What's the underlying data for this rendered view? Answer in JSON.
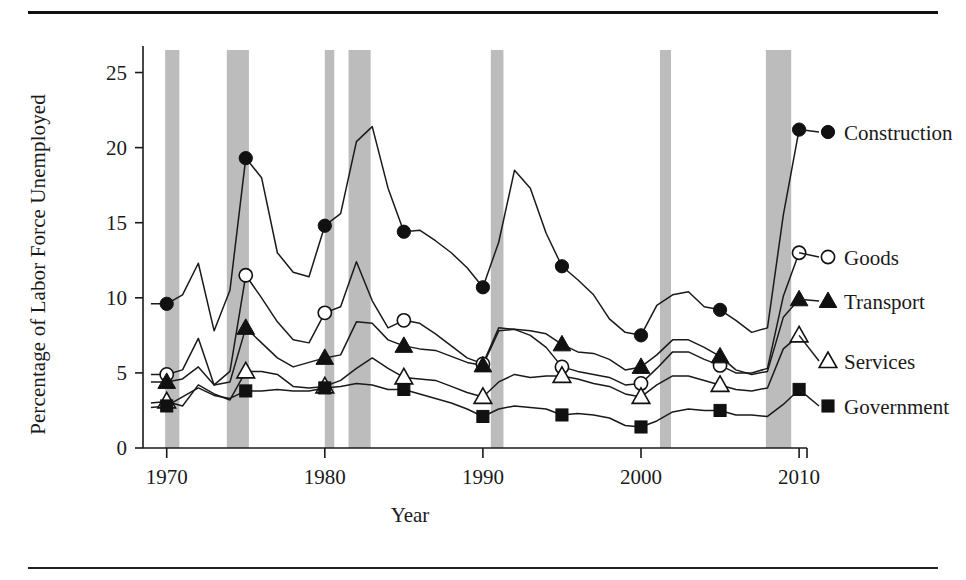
{
  "figure": {
    "xlabel": "Year",
    "ylabel": "Percentage of Labor Force Unemployed"
  },
  "chart_data": {
    "type": "line",
    "title": "",
    "xlabel": "Year",
    "ylabel": "Percentage of Labor Force Unemployed",
    "xlim": [
      1968.5,
      2010.5
    ],
    "ylim": [
      0,
      26.5
    ],
    "xticks": [
      1970,
      1980,
      1990,
      2000,
      2010
    ],
    "yticks": [
      0,
      5,
      10,
      15,
      20,
      25
    ],
    "grid": false,
    "legend_position": "right-outside",
    "marker_interval_years": 5,
    "recession_bands": [
      {
        "start": 1969.9,
        "end": 1970.8
      },
      {
        "start": 1973.8,
        "end": 1975.2
      },
      {
        "start": 1980.0,
        "end": 1980.6
      },
      {
        "start": 1981.5,
        "end": 1982.9
      },
      {
        "start": 1990.5,
        "end": 1991.3
      },
      {
        "start": 2001.2,
        "end": 2001.9
      },
      {
        "start": 2007.9,
        "end": 2009.5
      }
    ],
    "x": [
      1969,
      1970,
      1971,
      1972,
      1973,
      1974,
      1975,
      1976,
      1977,
      1978,
      1979,
      1980,
      1981,
      1982,
      1983,
      1984,
      1985,
      1986,
      1987,
      1988,
      1989,
      1990,
      1991,
      1992,
      1993,
      1994,
      1995,
      1996,
      1997,
      1998,
      1999,
      2000,
      2001,
      2002,
      2003,
      2004,
      2005,
      2006,
      2007,
      2008,
      2009,
      2010
    ],
    "series": [
      {
        "name": "Construction",
        "marker": "filled-circle",
        "values": [
          9.6,
          9.6,
          10.2,
          12.3,
          7.8,
          10.5,
          19.3,
          18.0,
          13.0,
          11.7,
          11.4,
          14.8,
          15.6,
          20.4,
          21.4,
          17.3,
          14.4,
          14.5,
          13.8,
          13.0,
          12.0,
          10.7,
          13.7,
          18.5,
          17.3,
          14.3,
          12.1,
          11.2,
          10.2,
          8.6,
          7.7,
          7.5,
          9.5,
          10.2,
          10.4,
          9.4,
          9.2,
          8.5,
          7.7,
          8.0,
          15.5,
          21.2
        ]
      },
      {
        "name": "Goods",
        "marker": "open-circle",
        "values": [
          4.9,
          4.9,
          5.2,
          7.3,
          4.2,
          5.1,
          11.5,
          10.0,
          8.4,
          7.2,
          7.0,
          9.0,
          9.4,
          12.4,
          9.8,
          8.0,
          8.5,
          8.3,
          7.6,
          6.8,
          6.0,
          5.6,
          8.0,
          7.9,
          7.5,
          6.7,
          5.4,
          5.1,
          4.9,
          4.7,
          4.2,
          4.3,
          5.3,
          6.4,
          6.4,
          5.9,
          5.5,
          5.0,
          5.0,
          5.3,
          10.1,
          13.0
        ]
      },
      {
        "name": "Transport",
        "marker": "filled-triangle",
        "values": [
          4.4,
          4.4,
          4.6,
          5.4,
          4.2,
          4.4,
          8.0,
          7.0,
          6.0,
          5.4,
          5.7,
          6.0,
          6.2,
          8.4,
          8.3,
          7.2,
          6.8,
          6.6,
          6.5,
          6.1,
          5.7,
          5.5,
          7.8,
          7.9,
          7.8,
          7.6,
          6.9,
          6.4,
          6.3,
          5.9,
          5.2,
          5.4,
          6.2,
          7.2,
          7.2,
          6.7,
          6.1,
          5.2,
          4.9,
          5.1,
          8.7,
          9.9
        ]
      },
      {
        "name": "Services",
        "marker": "open-triangle",
        "values": [
          3.0,
          3.1,
          2.8,
          4.2,
          3.6,
          3.2,
          5.1,
          5.1,
          4.9,
          4.1,
          4.0,
          4.1,
          4.5,
          5.3,
          6.0,
          5.3,
          4.7,
          4.6,
          4.5,
          4.1,
          3.7,
          3.4,
          4.4,
          4.9,
          4.7,
          4.8,
          4.8,
          4.6,
          4.3,
          4.1,
          3.6,
          3.4,
          4.2,
          4.8,
          4.8,
          4.5,
          4.2,
          3.9,
          3.8,
          4.0,
          6.6,
          7.5
        ]
      },
      {
        "name": "Government",
        "marker": "filled-square",
        "values": [
          2.7,
          2.8,
          3.4,
          4.0,
          3.5,
          3.3,
          3.8,
          3.8,
          3.9,
          3.8,
          3.8,
          4.0,
          4.1,
          4.3,
          4.2,
          3.9,
          3.9,
          3.6,
          3.3,
          3.0,
          2.6,
          2.1,
          2.6,
          2.8,
          2.7,
          2.6,
          2.2,
          2.3,
          2.2,
          2.0,
          1.5,
          1.4,
          1.8,
          2.4,
          2.6,
          2.5,
          2.5,
          2.2,
          2.2,
          2.1,
          2.9,
          3.9
        ]
      }
    ]
  },
  "legend": [
    {
      "label": "Construction",
      "marker": "filled-circle"
    },
    {
      "label": "Goods",
      "marker": "open-circle"
    },
    {
      "label": "Transport",
      "marker": "filled-triangle"
    },
    {
      "label": "Services",
      "marker": "open-triangle"
    },
    {
      "label": "Government",
      "marker": "filled-square"
    }
  ],
  "axis": {
    "x_tick_labels": [
      "1970",
      "1980",
      "1990",
      "2000",
      "2010"
    ],
    "y_tick_labels": [
      "0",
      "5",
      "10",
      "15",
      "20",
      "25"
    ]
  },
  "colors": {
    "line": "#1a1a1a",
    "recession_band": "#bcbcbc",
    "background": "#ffffff"
  }
}
